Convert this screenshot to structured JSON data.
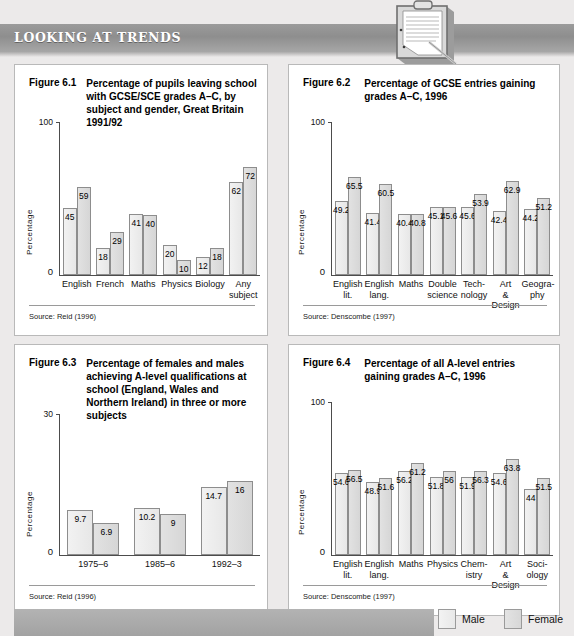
{
  "banner": {
    "title": "LOOKING AT TRENDS",
    "icon": "clipboard-icon"
  },
  "legend": {
    "male_label": "Male",
    "female_label": "Female",
    "male_color": "#eeeeee",
    "female_color": "#dcdcdc"
  },
  "figures": [
    {
      "number": "Figure 6.1",
      "caption": "Percentage of pupils leaving school with GCSE/SCE grades A–C, by subject and gender, Great Britain 1991/92",
      "source": "Source: Reid (1996)",
      "chart_data": {
        "type": "bar",
        "title": "Percentage of pupils leaving school with GCSE/SCE grades A–C, by subject and gender, Great Britain 1991/92",
        "xlabel": "",
        "ylabel": "Percentage",
        "ylim": [
          0,
          100
        ],
        "yticks": [
          "0",
          "100"
        ],
        "grid": false,
        "legend_position": "figure-bottom-right",
        "categories": [
          "English",
          "French",
          "Maths",
          "Physics",
          "Biology",
          "Any subject"
        ],
        "series": [
          {
            "name": "Male",
            "values": [
              45,
              18,
              41,
              20,
              12,
              62
            ]
          },
          {
            "name": "Female",
            "values": [
              59,
              29,
              40,
              10,
              18,
              72
            ]
          }
        ]
      }
    },
    {
      "number": "Figure 6.2",
      "caption": "Percentage of GCSE entries gaining grades A–C, 1996",
      "source": "Source: Denscombe (1997)",
      "chart_data": {
        "type": "bar",
        "title": "Percentage of GCSE entries gaining grades A–C, 1996",
        "xlabel": "",
        "ylabel": "Percentage",
        "ylim": [
          0,
          100
        ],
        "yticks": [
          "0",
          "100"
        ],
        "grid": false,
        "legend_position": "figure-bottom-right",
        "categories": [
          "English lit.",
          "English lang.",
          "Maths",
          "Double science",
          "Tech-nology",
          "Art & Design",
          "Geogra-phy"
        ],
        "series": [
          {
            "name": "Male",
            "values": [
              49.2,
              41.4,
              40.4,
              45.1,
              45.6,
              42.4,
              44.2
            ]
          },
          {
            "name": "Female",
            "values": [
              65.5,
              60.5,
              40.8,
              45.6,
              53.9,
              62.9,
              51.2
            ]
          }
        ]
      }
    },
    {
      "number": "Figure 6.3",
      "caption": "Percentage of females and males achieving A-level qualifications at school (England, Wales and Northern Ireland) in three or more subjects",
      "source": "Source: Reid (1996)",
      "chart_data": {
        "type": "bar",
        "title": "Percentage of females and males achieving A-level qualifications at school (England, Wales and Northern Ireland) in three or more subjects",
        "xlabel": "",
        "ylabel": "Percentage",
        "ylim": [
          0,
          30
        ],
        "yticks": [
          "0",
          "30"
        ],
        "grid": false,
        "legend_position": "figure-bottom-right",
        "categories": [
          "1975–6",
          "1985–6",
          "1992–3"
        ],
        "series": [
          {
            "name": "Male",
            "values": [
              9.7,
              10.2,
              14.7
            ]
          },
          {
            "name": "Female",
            "values": [
              6.9,
              9,
              16
            ]
          }
        ]
      }
    },
    {
      "number": "Figure 6.4",
      "caption": "Percentage of all A-level entries gaining grades A–C, 1996",
      "source": "Source: Denscombe (1997)",
      "chart_data": {
        "type": "bar",
        "title": "Percentage of all A-level entries gaining grades A–C, 1996",
        "xlabel": "",
        "ylabel": "Percentage",
        "ylim": [
          0,
          100
        ],
        "yticks": [
          "0",
          "100"
        ],
        "grid": false,
        "legend_position": "figure-bottom-right",
        "categories": [
          "English lit.",
          "English lang.",
          "Maths",
          "Physics",
          "Chem-istry",
          "Art & Design",
          "Soci-ology"
        ],
        "series": [
          {
            "name": "Male",
            "values": [
              54.6,
              48.9,
              56.2,
              51.8,
              51.9,
              54.6,
              44
            ]
          },
          {
            "name": "Female",
            "values": [
              56.5,
              51.6,
              61.2,
              56,
              56.3,
              63.8,
              51.5
            ]
          }
        ]
      }
    }
  ]
}
